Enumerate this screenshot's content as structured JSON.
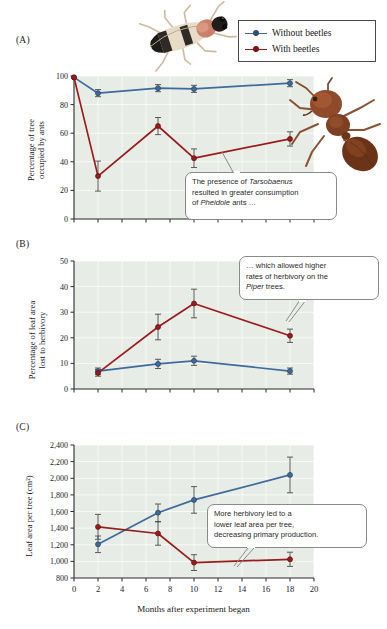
{
  "figure": {
    "xlabel": "Months after experiment began",
    "panels": [
      "(A)",
      "(B)",
      "(C)"
    ]
  },
  "legend": {
    "position": "top-right",
    "items": [
      {
        "label": "Without beetles",
        "color": "#3d6b9e",
        "symbol": "line-marker"
      },
      {
        "label": "With beetles",
        "color": "#9b1b1b",
        "symbol": "line-marker"
      }
    ]
  },
  "photos": [
    {
      "name": "beetle-photo",
      "caption": "Tarsobaenus beetle"
    },
    {
      "name": "ant-photo",
      "caption": "Pheidole ant"
    }
  ],
  "callouts": [
    {
      "panel": "A",
      "lines": [
        "The presence of Tarsobaenus",
        "resulted in greater consumption",
        "of Pheidole ants …"
      ],
      "italic_terms": [
        "Tarsobaenus",
        "Pheidole"
      ]
    },
    {
      "panel": "B",
      "lines": [
        "… which allowed higher",
        "rates of herbivory on the",
        "Piper trees."
      ],
      "italic_terms": [
        "Piper"
      ]
    },
    {
      "panel": "C",
      "lines": [
        "More herbivory led to a",
        "lower leaf area per tree,",
        "decreasing primary production."
      ],
      "italic_terms": []
    }
  ],
  "chart_data": [
    {
      "type": "line",
      "panel": "A",
      "title": "",
      "xlabel": "Months after experiment began",
      "ylabel": "Percentage of tree occupied by ants",
      "ylabel_lines": [
        "Percentage of tree",
        "occupied by ants"
      ],
      "xlim": [
        0,
        20
      ],
      "ylim": [
        0,
        100
      ],
      "xticks": [
        0,
        2,
        4,
        6,
        8,
        10,
        12,
        14,
        16,
        18,
        20
      ],
      "yticks": [
        0,
        20,
        40,
        60,
        80,
        100
      ],
      "ytick_labels": [
        "0",
        "20",
        "40",
        "60",
        "80",
        "100"
      ],
      "xtick_labels_shown": false,
      "grid": true,
      "series": [
        {
          "name": "Without beetles",
          "color": "#3d6b9e",
          "x": [
            0,
            2,
            7,
            10,
            18
          ],
          "values": [
            99,
            88,
            91.5,
            91,
            95
          ],
          "errors": [
            0,
            2.5,
            2.5,
            2.5,
            2.5
          ]
        },
        {
          "name": "With beetles",
          "color": "#9b1b1b",
          "x": [
            0,
            2,
            7,
            10,
            18
          ],
          "values": [
            99,
            30,
            65,
            42.5,
            56
          ],
          "errors": [
            0,
            10.5,
            6,
            6.5,
            5
          ]
        }
      ]
    },
    {
      "type": "line",
      "panel": "B",
      "title": "",
      "xlabel": "Months after experiment began",
      "ylabel": "Percentage of leaf area lost to herbivory",
      "ylabel_lines": [
        "Percentage of leaf area",
        "lost to herbivory"
      ],
      "xlim": [
        0,
        20
      ],
      "ylim": [
        0,
        50
      ],
      "xticks": [
        0,
        2,
        4,
        6,
        8,
        10,
        12,
        14,
        16,
        18,
        20
      ],
      "yticks": [
        0,
        10,
        20,
        30,
        40,
        50
      ],
      "ytick_labels": [
        "0",
        "10",
        "20",
        "30",
        "40",
        "50"
      ],
      "xtick_labels_shown": false,
      "grid": true,
      "series": [
        {
          "name": "Without beetles",
          "color": "#3d6b9e",
          "x": [
            2,
            7,
            10,
            18
          ],
          "values": [
            7,
            9.8,
            11,
            7
          ],
          "errors": [
            1.2,
            1.8,
            1.8,
            1.2
          ]
        },
        {
          "name": "With beetles",
          "color": "#9b1b1b",
          "x": [
            2,
            7,
            10,
            18
          ],
          "values": [
            6.3,
            24.2,
            33.4,
            20.8
          ],
          "errors": [
            1.3,
            5,
            5.6,
            2.6
          ]
        }
      ]
    },
    {
      "type": "line",
      "panel": "C",
      "title": "",
      "xlabel": "Months after experiment began",
      "ylabel": "Leaf area per tree (cm²)",
      "ylabel_lines": [
        "Leaf area per tree (cm²)"
      ],
      "xlim": [
        0,
        20
      ],
      "ylim": [
        800,
        2400
      ],
      "xticks": [
        0,
        2,
        4,
        6,
        8,
        10,
        12,
        14,
        16,
        18,
        20
      ],
      "yticks": [
        800,
        1000,
        1200,
        1400,
        1600,
        1800,
        2000,
        2200,
        2400
      ],
      "ytick_labels": [
        "800",
        "1,000",
        "1,200",
        "1,400",
        "1,600",
        "1,800",
        "2,000",
        "2,200",
        "2,400"
      ],
      "xtick_labels_shown": true,
      "xtick_labels": [
        "0",
        "2",
        "4",
        "6",
        "8",
        "10",
        "12",
        "14",
        "16",
        "18",
        "20"
      ],
      "grid": true,
      "series": [
        {
          "name": "Without beetles",
          "color": "#3d6b9e",
          "x": [
            2,
            7,
            10,
            18
          ],
          "values": [
            1205,
            1585,
            1740,
            2040
          ],
          "errors": [
            100,
            105,
            160,
            215
          ]
        },
        {
          "name": "With beetles",
          "color": "#9b1b1b",
          "x": [
            2,
            7,
            10,
            18
          ],
          "values": [
            1415,
            1335,
            985,
            1025
          ],
          "errors": [
            150,
            140,
            95,
            85
          ]
        }
      ]
    }
  ]
}
